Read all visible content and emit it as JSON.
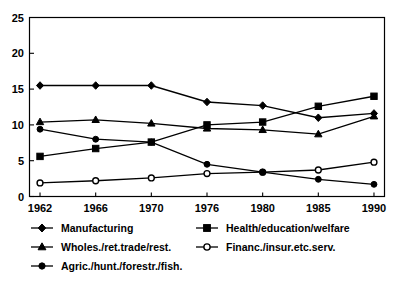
{
  "chart_data": {
    "type": "line",
    "title": "",
    "subtitle": "",
    "xlabel": "",
    "ylabel": "",
    "categories": [
      "1962",
      "1966",
      "1970",
      "1976",
      "1980",
      "1985",
      "1990"
    ],
    "ylim": [
      0,
      25
    ],
    "yticks": [
      0,
      5,
      10,
      15,
      20,
      25
    ],
    "ytick_labels": [
      "0",
      "5",
      "10",
      "15",
      "20",
      "25"
    ],
    "grid": false,
    "legend_position": "bottom",
    "series": [
      {
        "name": "Manufacturing",
        "marker": "diamond",
        "marker_style": "filled",
        "values": [
          15.5,
          15.5,
          15.5,
          13.2,
          12.7,
          11.0,
          11.6
        ]
      },
      {
        "name": "Health/education/welfare",
        "marker": "square",
        "marker_style": "filled",
        "values": [
          5.6,
          6.7,
          7.6,
          10.0,
          10.4,
          12.6,
          14.0
        ]
      },
      {
        "name": "Wholes./ret.trade/rest.",
        "marker": "triangle",
        "marker_style": "filled",
        "values": [
          10.4,
          10.7,
          10.2,
          9.5,
          9.3,
          8.7,
          11.2
        ]
      },
      {
        "name": "Financ./insur.etc.serv.",
        "marker": "circle",
        "marker_style": "open",
        "values": [
          1.9,
          2.2,
          2.6,
          3.2,
          3.4,
          3.7,
          4.8
        ]
      },
      {
        "name": "Agric./hunt./forestr./fish.",
        "marker": "circle",
        "marker_style": "filled",
        "values": [
          9.4,
          8.0,
          7.6,
          4.5,
          3.4,
          2.4,
          1.7
        ]
      }
    ]
  },
  "legend": {
    "entries": [
      {
        "label": "Manufacturing",
        "marker": "diamond",
        "style": "filled",
        "col": 0,
        "row": 0
      },
      {
        "label": "Health/education/welfare",
        "marker": "square",
        "style": "filled",
        "col": 1,
        "row": 0
      },
      {
        "label": "Wholes./ret.trade/rest.",
        "marker": "triangle",
        "style": "filled",
        "col": 0,
        "row": 1
      },
      {
        "label": "Financ./insur.etc.serv.",
        "marker": "circle",
        "style": "open",
        "col": 1,
        "row": 1
      },
      {
        "label": "Agric./hunt./forestr./fish.",
        "marker": "circle",
        "style": "filled",
        "col": 0,
        "row": 2
      }
    ]
  }
}
